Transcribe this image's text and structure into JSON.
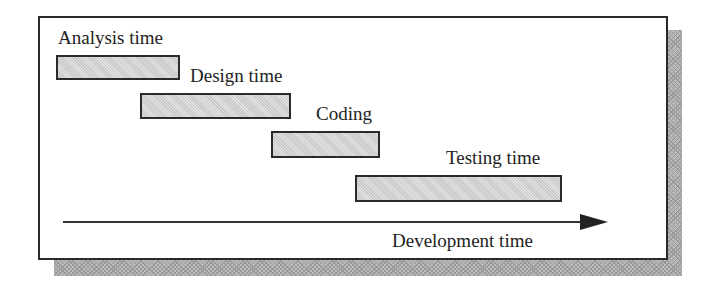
{
  "diagram": {
    "phases": [
      {
        "label": "Analysis time",
        "bar": {
          "x": 56,
          "y": 55,
          "w": 124,
          "h": 25
        },
        "label_pos": {
          "x": 58,
          "y": 28
        }
      },
      {
        "label": "Design time",
        "bar": {
          "x": 140,
          "y": 93,
          "w": 151,
          "h": 26
        },
        "label_pos": {
          "x": 190,
          "y": 66
        }
      },
      {
        "label": "Coding",
        "bar": {
          "x": 271,
          "y": 131,
          "w": 109,
          "h": 27
        },
        "label_pos": {
          "x": 316,
          "y": 104
        }
      },
      {
        "label": "Testing time",
        "bar": {
          "x": 355,
          "y": 175,
          "w": 207,
          "h": 27
        },
        "label_pos": {
          "x": 446,
          "y": 148
        }
      }
    ],
    "axis_label": "Development time"
  }
}
